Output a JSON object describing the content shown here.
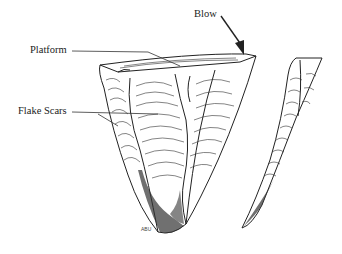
{
  "diagram": {
    "labels": {
      "blow": "Blow",
      "platform": "Platform",
      "flake_scars": "Flake Scars"
    },
    "signature": "ABU",
    "colors": {
      "ink": "#222222",
      "background": "#ffffff"
    }
  }
}
